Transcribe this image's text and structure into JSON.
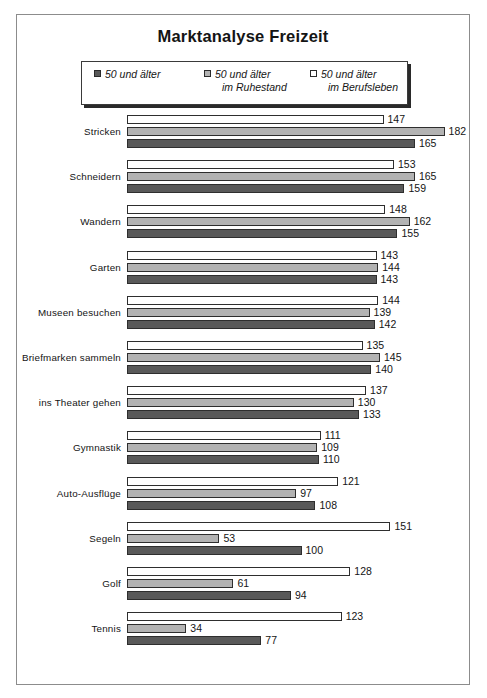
{
  "chart_data": {
    "type": "bar",
    "orientation": "horizontal",
    "title": "Marktanalyse Freizeit",
    "xlabel": "",
    "ylabel": "",
    "grid": false,
    "legend_position": "top",
    "xlim": [
      0,
      195
    ],
    "categories": [
      "Stricken",
      "Schneidern",
      "Wandern",
      "Garten",
      "Museen besuchen",
      "Briefmarken sammeln",
      "ins Theater gehen",
      "Gymnastik",
      "Auto-Ausflüge",
      "Segeln",
      "Golf",
      "Tennis"
    ],
    "series": [
      {
        "name": "50 und älter im Berufsleben",
        "style": "s-white",
        "color": "#ffffff",
        "values": [
          147,
          153,
          148,
          143,
          144,
          135,
          137,
          111,
          121,
          151,
          128,
          123
        ]
      },
      {
        "name": "50 und älter im Ruhestand",
        "style": "s-light",
        "color": "#b3b3b3",
        "values": [
          182,
          165,
          162,
          144,
          139,
          145,
          130,
          109,
          97,
          53,
          61,
          34
        ]
      },
      {
        "name": "50 und älter",
        "style": "s-dark",
        "color": "#595959",
        "values": [
          165,
          159,
          155,
          143,
          142,
          140,
          133,
          110,
          108,
          100,
          94,
          77
        ]
      }
    ]
  },
  "legend": {
    "entries": [
      {
        "swatch_color": "#595959",
        "line1": "50 und älter",
        "line2": ""
      },
      {
        "swatch_color": "#b3b3b3",
        "line1": "50 und älter",
        "line2": "im Ruhestand"
      },
      {
        "swatch_color": "#ffffff",
        "line1": "50 und älter",
        "line2": "im Berufsleben"
      }
    ]
  }
}
